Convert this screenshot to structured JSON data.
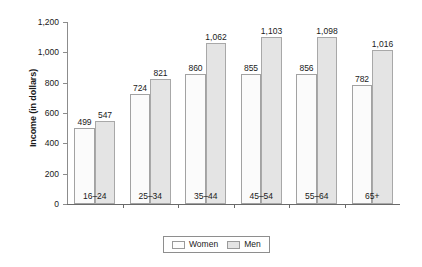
{
  "chart_data": {
    "type": "bar",
    "title": "",
    "subtitle": "",
    "xlabel": "",
    "ylabel": "Income (in dollars)",
    "categories": [
      "16–24",
      "25–34",
      "35–44",
      "45–54",
      "55–64",
      "65+"
    ],
    "series": [
      {
        "name": "Women",
        "color": "#fbfbfb",
        "values": [
          499,
          724,
          860,
          855,
          856,
          782
        ],
        "labels": [
          "499",
          "724",
          "860",
          "855",
          "856",
          "782"
        ]
      },
      {
        "name": "Men",
        "color": "#e4e4e4",
        "values": [
          547,
          821,
          1062,
          1103,
          1098,
          1016
        ],
        "labels": [
          "547",
          "821",
          "1,062",
          "1,103",
          "1,098",
          "1,016"
        ]
      }
    ],
    "ylim": [
      0,
      1200
    ],
    "yticks": [
      0,
      200,
      400,
      600,
      800,
      1000,
      1200
    ],
    "ytick_labels": [
      "0",
      "200",
      "400",
      "600",
      "800",
      "1,000",
      "1,200"
    ],
    "grid": false,
    "legend_position": "bottom-center",
    "legend_entries": [
      "Women",
      "Men"
    ]
  },
  "legend": {
    "items": [
      {
        "label": "Women",
        "swatch": "women-swatch"
      },
      {
        "label": "Men",
        "swatch": "men-swatch"
      }
    ]
  }
}
